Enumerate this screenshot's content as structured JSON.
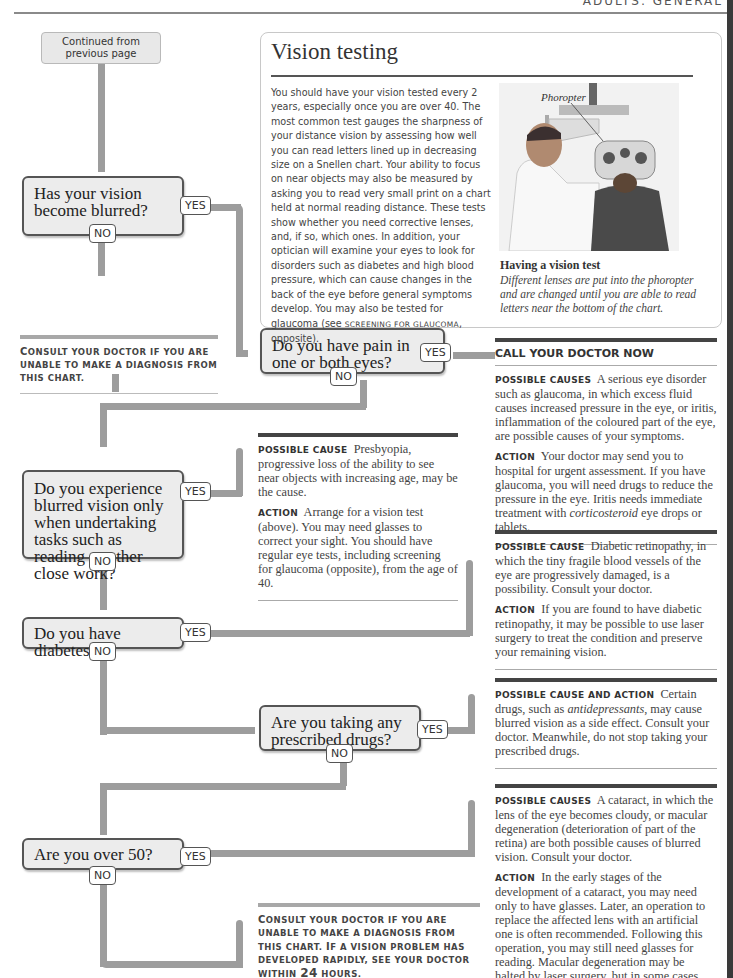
{
  "header": {
    "section": "ADULTS: GENERAL"
  },
  "start": {
    "label": "Continued from previous page"
  },
  "questions": [
    {
      "id": "q1",
      "text": "Has your vision become blurred?",
      "yes": "YES",
      "no": "NO"
    },
    {
      "id": "q2",
      "text": "Do you have pain in one or both eyes?",
      "yes": "YES",
      "no": "NO"
    },
    {
      "id": "q3",
      "text": "Do you experience blurred vision only when undertaking tasks such as reading or other close work?",
      "yes": "YES",
      "no": "NO"
    },
    {
      "id": "q4",
      "text": "Do you have diabetes?",
      "yes": "YES",
      "no": "NO"
    },
    {
      "id": "q5",
      "text": "Are you taking any prescribed drugs?",
      "yes": "YES",
      "no": "NO"
    },
    {
      "id": "q6",
      "text": "Are you over 50?",
      "yes": "YES",
      "no": "NO"
    }
  ],
  "consult_notes": [
    {
      "first": "C",
      "rest": "onsult your doctor if you are unable to make a diagnosis from this chart."
    },
    {
      "first": "C",
      "rest": "onsult your doctor if you are unable to make a diagnosis from this chart. ",
      "first2": "I",
      "rest2": "f a vision problem has developed rapidly, see your doctor within ",
      "hours": "24",
      "rest3": " hours."
    }
  ],
  "vision_testing": {
    "title": "Vision testing",
    "body_pre": "You should have your vision tested every 2 years, especially once you are over 40. The most common test gauges the sharpness of your distance vision by assessing how well you can read letters lined up in decreasing size on a Snellen chart. Your ability to focus on near objects may also be measured by asking you to read very small print on a chart held at normal reading distance. These tests show whether you need corrective lenses, and, if so, which ones. In addition, your optician will examine your eyes to look for disorders such as diabetes and high blood pressure, which can cause changes in the back of the eye before general symptoms develop. You may also be tested for glaucoma (see ",
    "body_ref": "Screening for glaucoma",
    "body_post": ", opposite).",
    "photo_label": "Phoropter",
    "caption_title": "Having a vision test",
    "caption": "Different lenses are put into the phoropter and are changed until you are able to read letters near the bottom of the chart."
  },
  "results": {
    "pain": {
      "heading": "CALL YOUR DOCTOR NOW",
      "cause_label": "Possible causes",
      "cause_text": "A serious eye disorder such as glaucoma, in which excess fluid causes increased pressure in the eye, or iritis, inflammation of the coloured part of the eye, are possible causes of your symptoms.",
      "action_label": "Action",
      "action_text_pre": "Your doctor may send you to hospital for urgent assessment. If you have glaucoma, you will need drugs to reduce the pressure in the eye. Iritis needs immediate treatment with ",
      "action_italic": "corticosteroid",
      "action_text_post": " eye drops or tablets."
    },
    "presbyopia": {
      "cause_label": "Possible cause",
      "cause_text": "Presbyopia, progressive loss of the ability to see near objects with increasing age, may be the cause.",
      "action_label": "Action",
      "action_text": "Arrange for a vision test (above). You may need glasses to correct your sight. You should have regular eye tests, including screening for glaucoma (opposite), from the age of 40."
    },
    "diabetes": {
      "cause_label": "Possible cause",
      "cause_text": "Diabetic retinopathy, in which the tiny fragile blood vessels of the eye are progressively damaged, is a possibility. Consult your doctor.",
      "action_label": "Action",
      "action_text": "If you are found to have diabetic retinopathy, it may be possible to use laser surgery to treat the condition and preserve your remaining vision."
    },
    "drugs": {
      "label": "Possible cause and action",
      "text_pre": "Certain drugs, such as ",
      "italic": "antidepressants",
      "text_post": ", may cause blurred vision as a side effect. Consult your doctor. Meanwhile, do not stop taking your prescribed drugs."
    },
    "over50": {
      "cause_label": "Possible causes",
      "cause_text": "A cataract, in which the lens of the eye becomes cloudy, or macular degeneration (deterioration of part of the retina) are both possible causes of blurred vision. Consult your doctor.",
      "action_label": "Action",
      "action_text": "In the early stages of the development of a cataract, you may need only to have glasses. Later, an operation to replace the affected lens with an artificial one is often recommended. Following this operation, you may still need glasses for reading. Macular degeneration may be halted by laser surgery, but in some cases vision is progressively lost."
    }
  },
  "colors": {
    "pipe": "#9d9d9d",
    "box_fill": "#ececec",
    "box_border": "#555555",
    "rule_dark": "#444444"
  }
}
